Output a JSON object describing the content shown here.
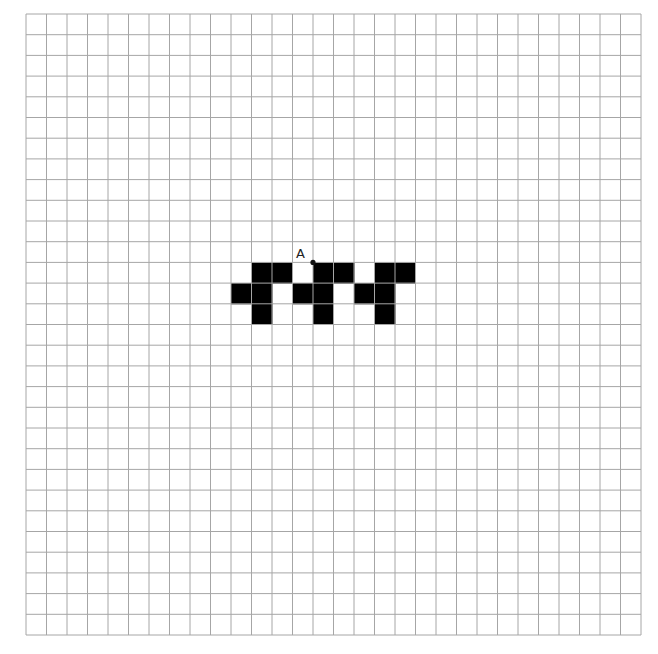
{
  "grid": {
    "columns": 30,
    "rows": 30,
    "origin_x": 26,
    "origin_y": 14,
    "cell_w": 20.5,
    "cell_h": 20.7,
    "line_color": "#a6a6a6",
    "fill_color": "#000000"
  },
  "filled_cells": [
    {
      "row": 12,
      "col": 11
    },
    {
      "row": 12,
      "col": 12
    },
    {
      "row": 12,
      "col": 14
    },
    {
      "row": 12,
      "col": 15
    },
    {
      "row": 12,
      "col": 17
    },
    {
      "row": 12,
      "col": 18
    },
    {
      "row": 13,
      "col": 10
    },
    {
      "row": 13,
      "col": 11
    },
    {
      "row": 13,
      "col": 13
    },
    {
      "row": 13,
      "col": 14
    },
    {
      "row": 13,
      "col": 16
    },
    {
      "row": 13,
      "col": 17
    },
    {
      "row": 14,
      "col": 11
    },
    {
      "row": 14,
      "col": 14
    },
    {
      "row": 14,
      "col": 17
    }
  ],
  "point": {
    "label": "A",
    "grid_col": 14,
    "grid_row": 12,
    "label_x": 296,
    "label_y": 247
  }
}
